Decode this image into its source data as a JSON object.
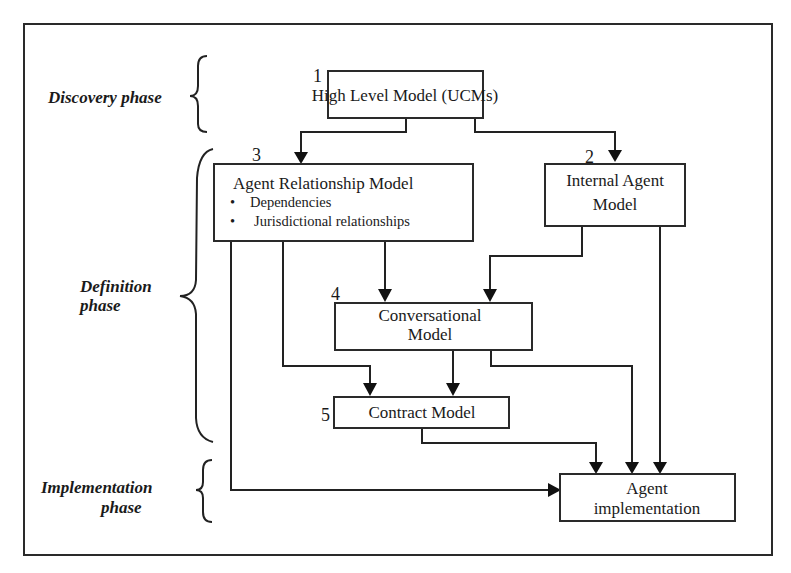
{
  "phases": {
    "discovery": {
      "label": "Discovery  phase"
    },
    "definition": {
      "line1": "Definition",
      "line2": "phase"
    },
    "implementation": {
      "line1": "Implementation",
      "line2": "phase"
    }
  },
  "boxes": {
    "high_level": {
      "number": "1",
      "label": "High Level Model (UCMs)"
    },
    "internal_agent": {
      "number": "2",
      "line1": "Internal Agent",
      "line2": "Model"
    },
    "agent_relationship": {
      "number": "3",
      "title": "Agent Relationship Model",
      "bullets": [
        "Dependencies",
        "Jurisdictional relationships"
      ]
    },
    "conversational": {
      "number": "4",
      "line1": "Conversational",
      "line2": "Model"
    },
    "contract": {
      "number": "5",
      "label": "Contract Model"
    },
    "agent_implementation": {
      "line1": "Agent",
      "line2": "implementation"
    }
  },
  "edges": [
    {
      "from": "High Level Model",
      "to": "Agent Relationship Model"
    },
    {
      "from": "High Level Model",
      "to": "Internal Agent Model"
    },
    {
      "from": "Agent Relationship Model",
      "to": "Conversational Model"
    },
    {
      "from": "Internal Agent Model",
      "to": "Conversational Model"
    },
    {
      "from": "Agent Relationship Model",
      "to": "Contract Model"
    },
    {
      "from": "Conversational Model",
      "to": "Contract Model"
    },
    {
      "from": "Contract Model",
      "to": "Agent implementation"
    },
    {
      "from": "Conversational Model",
      "to": "Agent implementation"
    },
    {
      "from": "Internal Agent Model",
      "to": "Agent implementation"
    },
    {
      "from": "Agent Relationship Model",
      "to": "Agent implementation"
    }
  ],
  "bullet_glyph": "•"
}
